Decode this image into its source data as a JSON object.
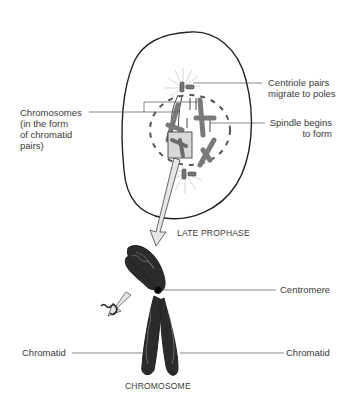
{
  "diagram": {
    "stage_label": "LATE PROPHASE",
    "figure_label": "CHROMOSOME",
    "labels": {
      "centriole_line1": "Centriole pairs",
      "centriole_line2": "migrate to poles",
      "chromosomes_line1": "Chromosomes",
      "chromosomes_line2": "(in the form",
      "chromosomes_line3": "of chromatid",
      "chromosomes_line4": "pairs)",
      "spindle_line1": "Spindle begins",
      "spindle_line2": "to form",
      "centromere": "Centromere",
      "chromatid_left": "Chromatid",
      "chromatid_right": "Chromatid"
    },
    "colors": {
      "outline": "#222222",
      "chromosome_gray": "#7a7a7a",
      "chromosome_dark": "#2b2b2b",
      "arrow_fill": "#e6e6e6",
      "leader_line": "#555555"
    }
  }
}
